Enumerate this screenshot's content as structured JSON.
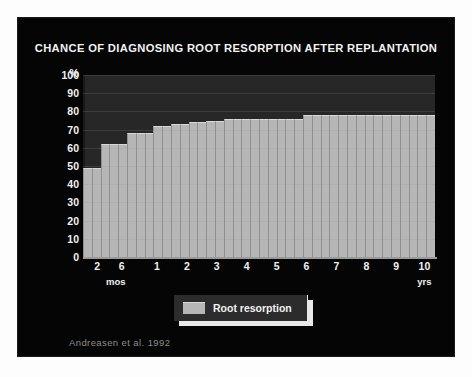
{
  "slide": {
    "background_color": "#050505",
    "page_color": "#fdfdfd"
  },
  "title": "CHANCE OF DIAGNOSING ROOT RESORPTION AFTER REPLANTATION",
  "citation": "Andreasen et al. 1992",
  "legend": {
    "label": "Root resorption",
    "swatch_color": "#b6b6b6"
  },
  "axes": {
    "y_unit": "%",
    "y_ticks": [
      "100",
      "90",
      "80",
      "70",
      "60",
      "50",
      "40",
      "30",
      "20",
      "10",
      "0"
    ],
    "x_sub_left": "mos",
    "x_sub_right": "yrs"
  },
  "chart_data": {
    "type": "bar",
    "title": "CHANCE OF DIAGNOSING ROOT RESORPTION AFTER REPLANTATION",
    "subtitle": "",
    "xlabel": "",
    "ylabel": "%",
    "ylim": [
      0,
      100
    ],
    "ytick_values": [
      0,
      10,
      20,
      30,
      40,
      50,
      60,
      70,
      80,
      90,
      100
    ],
    "grid": true,
    "legend_position": "below-plot-center",
    "bar_color": "#b6b6b6",
    "plot_background": "#272727",
    "annotation": "Andreasen et al. 1992",
    "x_axis_tick_labels": [
      "2",
      "6",
      "1",
      "2",
      "3",
      "4",
      "5",
      "6",
      "7",
      "8",
      "9",
      "10"
    ],
    "x_axis_tick_positions_pct": [
      4.0,
      11.0,
      21.0,
      29.5,
      38.0,
      46.5,
      55.0,
      63.5,
      72.0,
      80.5,
      89.0,
      97.0
    ],
    "x_axis_units": {
      "left": "mos",
      "right": "yrs"
    },
    "series": [
      {
        "name": "Root resorption",
        "categories": [
          "2 mos",
          "3 mos",
          "4 mos",
          "5 mos",
          "6 mos",
          "8 mos",
          "10 mos",
          "1 yr",
          "1.3 yrs",
          "1.6 yrs",
          "2 yrs",
          "2.3 yrs",
          "2.6 yrs",
          "3 yrs",
          "3.3 yrs",
          "3.6 yrs",
          "4 yrs",
          "4.3 yrs",
          "4.6 yrs",
          "5 yrs",
          "5.3 yrs",
          "5.6 yrs",
          "6 yrs",
          "6.3 yrs",
          "6.6 yrs",
          "7 yrs",
          "7.3 yrs",
          "7.6 yrs",
          "8 yrs",
          "8.3 yrs",
          "8.6 yrs",
          "9 yrs",
          "9.3 yrs",
          "9.6 yrs",
          "10 yrs",
          "10.3 yrs",
          "10.6 yrs",
          "11 yrs",
          "11.3 yrs",
          "11.6 yrs"
        ],
        "values": [
          49,
          49,
          62,
          62,
          62,
          68,
          68,
          68,
          72,
          72,
          73,
          73,
          74,
          74,
          75,
          75,
          76,
          76,
          76,
          76,
          76,
          76,
          76,
          76,
          76,
          78,
          78,
          78,
          78,
          78,
          78,
          78,
          78,
          78,
          78,
          78,
          78,
          78,
          78,
          78
        ]
      }
    ]
  }
}
